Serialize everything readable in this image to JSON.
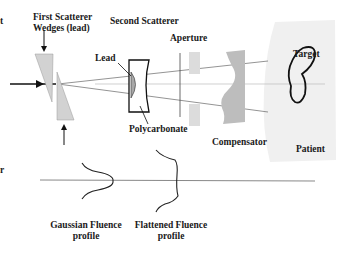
{
  "diagram": {
    "labels": {
      "first_scatterer_line1": "First Scatterer",
      "first_scatterer_line2": "Wedges (lead)",
      "second_scatterer": "Second Scatterer",
      "aperture": "Aperture",
      "lead": "Lead",
      "polycarbonate": "Polycarbonate",
      "compensator": "Compensator",
      "target": "Target",
      "patient": "Patient",
      "gaussian_line1": "Gaussian Fluence",
      "gaussian_line2": "profile",
      "flattened_line1": "Flattened Fluence",
      "flattened_line2": "profile",
      "left_cut_1": "t",
      "left_cut_2": "r"
    },
    "colors": {
      "wedge_fill": "#d2d2d2",
      "lead_fill": "#a8a8a8",
      "aperture_fill": "#dcdcdc",
      "compensator_fill": "#bdbdbd",
      "patient_fill": "#f0f0f0",
      "line": "#1a1a1a",
      "ray": "#555555"
    }
  }
}
